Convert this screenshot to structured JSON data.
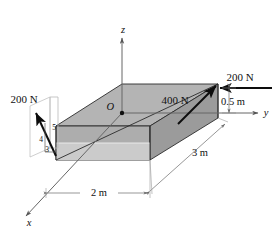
{
  "figure": {
    "kind": "statics-free-body-diagram",
    "axes": {
      "z_label": "z",
      "y_label": "y",
      "x_label": "x",
      "origin_label": "O"
    },
    "forces": [
      {
        "id": "force-right",
        "label": "200 N",
        "direction": "horizontal, pointing left toward block top-right corner"
      },
      {
        "id": "force-diagonal",
        "label": "400 N",
        "direction": "up and to the right along top face diagonal"
      },
      {
        "id": "force-left",
        "label": "200 N",
        "direction": "up and to the left from block front-left corner"
      }
    ],
    "slope_triangle": {
      "hypotenuse": "5",
      "vertical": "4",
      "horizontal": "3"
    },
    "dimensions": [
      {
        "id": "dim-width",
        "label": "2 m"
      },
      {
        "id": "dim-length",
        "label": "3 m"
      },
      {
        "id": "dim-height",
        "label": "0.5 m"
      }
    ],
    "colors": {
      "top_face": "#b8b8b8",
      "front_face": "#a9a9a9",
      "right_face": "#9a9a9a",
      "bottom_strip": "#cfcfcf",
      "outline": "#2b2b2b",
      "arrow": "#0d0d0d",
      "axis": "#555555",
      "dimension_line": "#777777",
      "background": "#ffffff"
    }
  }
}
